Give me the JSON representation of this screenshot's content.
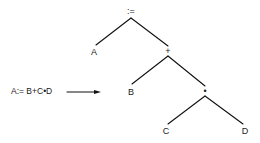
{
  "diagram": {
    "type": "parse-tree",
    "expression": "A:= B+C•D",
    "arrow": "right-arrow",
    "nodes": {
      "root": ":=",
      "assign_left": "A",
      "plus": "+",
      "plus_left": "B",
      "times": "•",
      "times_left": "C",
      "times_right": "D"
    },
    "edges": [
      [
        ":=",
        "A"
      ],
      [
        ":=",
        "+"
      ],
      [
        "+",
        "B"
      ],
      [
        "+",
        "•"
      ],
      [
        "•",
        "C"
      ],
      [
        "•",
        "D"
      ]
    ],
    "line_color": "#111111"
  }
}
